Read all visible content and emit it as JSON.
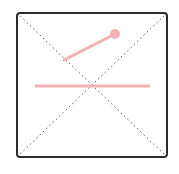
{
  "diagram": {
    "frame": {
      "x": 17,
      "y": 13,
      "width": 150,
      "height": 144,
      "rx": 3,
      "stroke": "#2b2b2b",
      "stroke_width": 2
    },
    "diagonals": {
      "stroke": "#555555",
      "dash": "1.5 3"
    },
    "accent_color": "#f4b0b6",
    "slanted_segment": {
      "x1": 64,
      "y1": 60,
      "x2": 115,
      "y2": 34,
      "width": 3
    },
    "endpoint_circle": {
      "cx": 115,
      "cy": 34,
      "r": 5
    },
    "horizontal_segment": {
      "x1": 36,
      "y1": 86,
      "x2": 149,
      "y2": 86,
      "width": 3
    }
  }
}
